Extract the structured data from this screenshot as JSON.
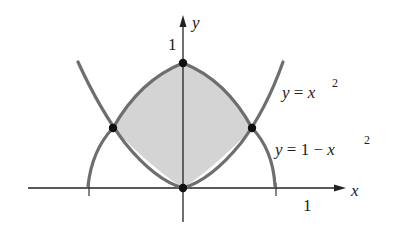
{
  "figure": {
    "axes": {
      "x_label": "x",
      "y_label": "y",
      "x_tick_label": "1",
      "y_tick_label": "1"
    },
    "curves": [
      {
        "name": "parabola-up",
        "equation_lhs": "y = x",
        "exponent": "2",
        "formula": "y = x^2"
      },
      {
        "name": "parabola-down",
        "equation_lhs": "y = 1 − x",
        "exponent": "2",
        "formula": "y = 1 - x^2"
      }
    ],
    "points": [
      {
        "label": "(0,1)",
        "x": 0,
        "y": 1
      },
      {
        "label": "(-1/√2, 1/2)",
        "x": -0.707,
        "y": 0.5
      },
      {
        "label": "(1/√2, 1/2)",
        "x": 0.707,
        "y": 0.5
      },
      {
        "label": "(0,0)",
        "x": 0,
        "y": 0
      }
    ],
    "shaded_region": "region between y = x^2 and y = 1 - x^2",
    "colors": {
      "curve": "#6e6e6e",
      "fill": "#d4d4d4",
      "axis": "#222222",
      "point": "#111111"
    }
  }
}
